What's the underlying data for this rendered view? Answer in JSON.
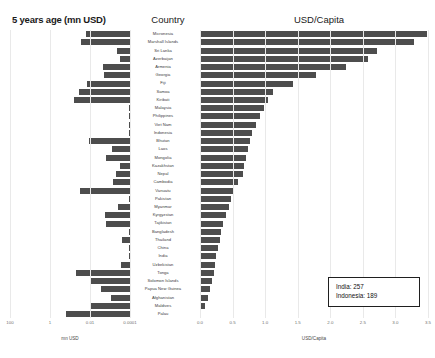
{
  "titles": {
    "left": "5 years age (mn USD)",
    "middle": "Country",
    "right": "USD/Capita"
  },
  "axes": {
    "left_label": "mn USD",
    "right_label": "USD/Capita",
    "left_ticks": [
      "100",
      "1",
      "0.01",
      "0.0001"
    ],
    "right_ticks": [
      "0.0",
      "0.5",
      "1.0",
      "1.5",
      "2.0",
      "2.5",
      "3.0",
      "3.5"
    ]
  },
  "annotation": {
    "line1": "India: 257",
    "line2": "Indonesia: 189"
  },
  "colors": {
    "bar": "#4d4d4d",
    "grid": "#e9e9e9",
    "text": "#3a3a3a",
    "annotation_border": "#1f1f1f"
  },
  "chart_data": {
    "type": "bar",
    "title": "USD/Capita",
    "orientation": "horizontal",
    "panels": [
      {
        "name": "left",
        "title": "5 years age (mn USD)",
        "xlabel": "mn USD",
        "scale": "log",
        "reversed": true,
        "xlim": [
          100,
          0.0001
        ],
        "tick_values": [
          100,
          1,
          0.01,
          0.0001
        ]
      },
      {
        "name": "right",
        "title": "USD/Capita",
        "xlabel": "USD/Capita",
        "scale": "linear",
        "xlim": [
          0.0,
          3.5
        ],
        "tick_values": [
          0.0,
          0.5,
          1.0,
          1.5,
          2.0,
          2.5,
          3.0,
          3.5
        ]
      }
    ],
    "categories": [
      "Micronesia",
      "Marshall Islands",
      "Sri Lanka",
      "Azerbaijan",
      "Armenia",
      "Georgia",
      "Fiji",
      "Samoa",
      "Kiribati",
      "Malaysia",
      "Philippines",
      "Viet Nam",
      "Indonesia",
      "Bhutan",
      "Laos",
      "Mongolia",
      "Kazakhstan",
      "Nepal",
      "Cambodia",
      "Vanuatu",
      "Pakistan",
      "Myanmar",
      "Kyrgyzstan",
      "Tajikistan",
      "Bangladesh",
      "Thailand",
      "China",
      "India",
      "Uzbekistan",
      "Tonga",
      "Solomon Islands",
      "Papua New Guinea",
      "Afghanistan",
      "Maldives",
      "Palau"
    ],
    "series": [
      {
        "name": "5 years age (mn USD)",
        "panel": "left",
        "values": [
          0.62,
          0.35,
          22.0,
          32.0,
          4.6,
          5.2,
          0.72,
          0.28,
          0.16,
          88.0,
          120.0,
          140.0,
          310.0,
          0.9,
          12.0,
          6.0,
          30.0,
          20.0,
          14.0,
          0.33,
          180.0,
          26.0,
          5.5,
          6.5,
          150.0,
          40.0,
          600.0,
          520.0,
          34.0,
          0.2,
          0.95,
          3.4,
          11.0,
          1.1,
          0.06
        ]
      },
      {
        "name": "USD/Capita",
        "panel": "right",
        "values": [
          3.48,
          3.28,
          2.72,
          2.58,
          2.24,
          1.78,
          1.42,
          1.12,
          1.04,
          0.98,
          0.92,
          0.86,
          0.8,
          0.76,
          0.74,
          0.7,
          0.68,
          0.66,
          0.58,
          0.52,
          0.48,
          0.44,
          0.4,
          0.36,
          0.32,
          0.3,
          0.28,
          0.25,
          0.23,
          0.21,
          0.19,
          0.16,
          0.13,
          0.08,
          0.02
        ]
      }
    ]
  }
}
